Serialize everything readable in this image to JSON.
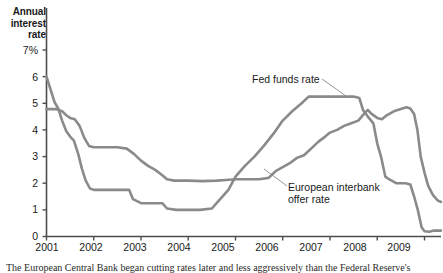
{
  "chart_data": {
    "type": "line",
    "title": "",
    "ylabel": "Annual interest rate",
    "xlabel": "",
    "ylim": [
      0,
      7
    ],
    "xlim": [
      2001,
      2009.35
    ],
    "grid": false,
    "legend_position": "inline-annotations",
    "ytick_labels": [
      "7%",
      "6",
      "5",
      "4",
      "3",
      "2",
      "1",
      "0"
    ],
    "ytick_values": [
      7,
      6,
      5,
      4,
      3,
      2,
      1,
      0
    ],
    "xtick_labels": [
      "2001",
      "2002",
      "2003",
      "2004",
      "2005",
      "2006",
      "2007",
      "2008",
      "2009"
    ],
    "xtick_values": [
      2001,
      2002,
      2003,
      2004,
      2005,
      2006,
      2007,
      2008,
      2009
    ],
    "series": [
      {
        "name": "Fed funds rate",
        "color": "#8a8a8a",
        "points": [
          [
            2001.0,
            6.0
          ],
          [
            2001.08,
            5.55
          ],
          [
            2001.17,
            5.05
          ],
          [
            2001.25,
            4.8
          ],
          [
            2001.33,
            4.35
          ],
          [
            2001.42,
            3.95
          ],
          [
            2001.5,
            3.75
          ],
          [
            2001.58,
            3.6
          ],
          [
            2001.67,
            3.1
          ],
          [
            2001.75,
            2.55
          ],
          [
            2001.83,
            2.1
          ],
          [
            2001.92,
            1.8
          ],
          [
            2002.0,
            1.75
          ],
          [
            2002.25,
            1.75
          ],
          [
            2002.5,
            1.75
          ],
          [
            2002.75,
            1.75
          ],
          [
            2002.83,
            1.4
          ],
          [
            2003.0,
            1.25
          ],
          [
            2003.25,
            1.25
          ],
          [
            2003.45,
            1.25
          ],
          [
            2003.55,
            1.05
          ],
          [
            2003.75,
            1.0
          ],
          [
            2004.0,
            1.0
          ],
          [
            2004.25,
            1.0
          ],
          [
            2004.5,
            1.05
          ],
          [
            2004.6,
            1.25
          ],
          [
            2004.75,
            1.55
          ],
          [
            2004.85,
            1.75
          ],
          [
            2005.0,
            2.25
          ],
          [
            2005.2,
            2.65
          ],
          [
            2005.4,
            3.0
          ],
          [
            2005.6,
            3.4
          ],
          [
            2005.8,
            3.85
          ],
          [
            2006.0,
            4.35
          ],
          [
            2006.2,
            4.7
          ],
          [
            2006.4,
            5.0
          ],
          [
            2006.55,
            5.25
          ],
          [
            2006.75,
            5.25
          ],
          [
            2007.0,
            5.25
          ],
          [
            2007.25,
            5.25
          ],
          [
            2007.5,
            5.25
          ],
          [
            2007.62,
            5.2
          ],
          [
            2007.7,
            4.75
          ],
          [
            2007.8,
            4.5
          ],
          [
            2007.92,
            4.25
          ],
          [
            2008.0,
            3.5
          ],
          [
            2008.08,
            3.0
          ],
          [
            2008.17,
            2.25
          ],
          [
            2008.25,
            2.15
          ],
          [
            2008.4,
            2.0
          ],
          [
            2008.6,
            2.0
          ],
          [
            2008.7,
            1.95
          ],
          [
            2008.78,
            1.5
          ],
          [
            2008.86,
            1.0
          ],
          [
            2008.94,
            0.35
          ],
          [
            2009.0,
            0.2
          ],
          [
            2009.1,
            0.18
          ],
          [
            2009.2,
            0.22
          ],
          [
            2009.35,
            0.22
          ]
        ]
      },
      {
        "name": "European interbank offer rate",
        "color": "#8a8a8a",
        "points": [
          [
            2001.0,
            4.78
          ],
          [
            2001.2,
            4.78
          ],
          [
            2001.33,
            4.7
          ],
          [
            2001.42,
            4.55
          ],
          [
            2001.5,
            4.45
          ],
          [
            2001.6,
            4.4
          ],
          [
            2001.7,
            4.15
          ],
          [
            2001.8,
            3.7
          ],
          [
            2001.9,
            3.4
          ],
          [
            2002.0,
            3.35
          ],
          [
            2002.25,
            3.35
          ],
          [
            2002.5,
            3.35
          ],
          [
            2002.7,
            3.3
          ],
          [
            2002.85,
            3.1
          ],
          [
            2003.0,
            2.85
          ],
          [
            2003.15,
            2.65
          ],
          [
            2003.3,
            2.5
          ],
          [
            2003.45,
            2.3
          ],
          [
            2003.55,
            2.15
          ],
          [
            2003.7,
            2.1
          ],
          [
            2004.0,
            2.1
          ],
          [
            2004.3,
            2.08
          ],
          [
            2004.6,
            2.1
          ],
          [
            2004.8,
            2.12
          ],
          [
            2005.0,
            2.15
          ],
          [
            2005.25,
            2.15
          ],
          [
            2005.5,
            2.15
          ],
          [
            2005.7,
            2.2
          ],
          [
            2005.85,
            2.45
          ],
          [
            2006.0,
            2.6
          ],
          [
            2006.15,
            2.75
          ],
          [
            2006.3,
            2.95
          ],
          [
            2006.45,
            3.05
          ],
          [
            2006.6,
            3.3
          ],
          [
            2006.75,
            3.55
          ],
          [
            2006.9,
            3.75
          ],
          [
            2007.0,
            3.9
          ],
          [
            2007.15,
            4.0
          ],
          [
            2007.3,
            4.15
          ],
          [
            2007.45,
            4.25
          ],
          [
            2007.6,
            4.35
          ],
          [
            2007.72,
            4.6
          ],
          [
            2007.8,
            4.75
          ],
          [
            2007.88,
            4.6
          ],
          [
            2008.0,
            4.45
          ],
          [
            2008.1,
            4.4
          ],
          [
            2008.2,
            4.55
          ],
          [
            2008.35,
            4.7
          ],
          [
            2008.5,
            4.78
          ],
          [
            2008.62,
            4.85
          ],
          [
            2008.7,
            4.8
          ],
          [
            2008.78,
            4.6
          ],
          [
            2008.85,
            4.0
          ],
          [
            2008.92,
            3.0
          ],
          [
            2009.0,
            2.4
          ],
          [
            2009.08,
            1.9
          ],
          [
            2009.18,
            1.55
          ],
          [
            2009.28,
            1.35
          ],
          [
            2009.35,
            1.3
          ]
        ]
      }
    ],
    "annotations": [
      {
        "text": "Fed funds rate",
        "target_x": 2007.05,
        "target_y": 5.25
      },
      {
        "text_line1": "European interbank",
        "text_line2": "offer rate",
        "target_x": 2006.45,
        "target_y": 3.05
      }
    ]
  },
  "axis_title": {
    "line1": "Annual",
    "line2": "interest",
    "line3": "rate"
  },
  "annotations": {
    "fed_funds_label": "Fed funds rate",
    "euribor_label_line1": "European interbank",
    "euribor_label_line2": "offer rate"
  },
  "caption": {
    "text": "The European Central Bank began cutting rates later and less aggressively than the Federal Reserve's"
  },
  "colors": {
    "line": "#8a8a8a",
    "axis": "#4d4d4d",
    "text": "#1a1a1a"
  }
}
